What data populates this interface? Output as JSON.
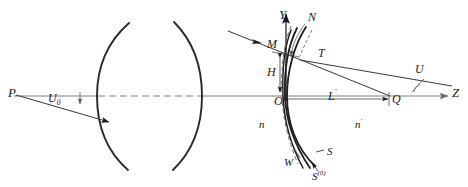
{
  "figure": {
    "colors": {
      "stroke": "#1a1a1a",
      "axis": "#6b6b6b",
      "dashed": "#7a7a7a",
      "background": "#ffffff"
    }
  },
  "labels": {
    "source_point": "P",
    "object_angle": "U",
    "object_angle_sub": "0",
    "y_axis": "Y",
    "z_axis": "Z",
    "normal": "N",
    "marginal_point": "M",
    "ray_height": "H",
    "tangent_point": "T",
    "vertex": "O",
    "image_distance": "L",
    "image_distance_prime": "′",
    "image_point": "Q",
    "image_angle": "U",
    "index_object": "n",
    "index_image": "n",
    "index_image_prime": "′",
    "wavefront": "W",
    "surface": "S",
    "reference_sphere": "S",
    "reference_sphere_sup": "(0)"
  },
  "geometry": {
    "axis_y": 96,
    "lens_left_vertex_x": 97,
    "lens_right_vertex_x": 202,
    "origin_x": 286,
    "image_point_x": 390,
    "source_x": 14
  }
}
